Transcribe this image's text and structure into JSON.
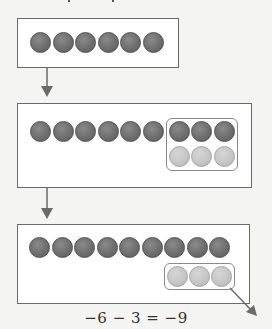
{
  "diagram": {
    "type": "integer-counter-model",
    "steps": [
      {
        "name": "start",
        "dark_counters": 6,
        "light_counters": 0,
        "grouped_pair": false
      },
      {
        "name": "add-zero-pairs",
        "dark_counters": 9,
        "light_counters": 3,
        "grouped_pair": true,
        "group_note": "3 dark + 3 light counters grouped as zero pairs"
      },
      {
        "name": "remove-light",
        "dark_counters": 9,
        "light_counters": 3,
        "grouped_light_removed": true,
        "group_note": "3 light counters grouped and taken away (arrow out)"
      }
    ],
    "equation": "−6 − 3 = −9"
  },
  "colors": {
    "dark_counter": "#6e6e6e",
    "light_counter": "#c6c6c6",
    "panel_border": "#6a6a6a",
    "arrow": "#6a6a6a",
    "background": "#f4f4f2"
  }
}
